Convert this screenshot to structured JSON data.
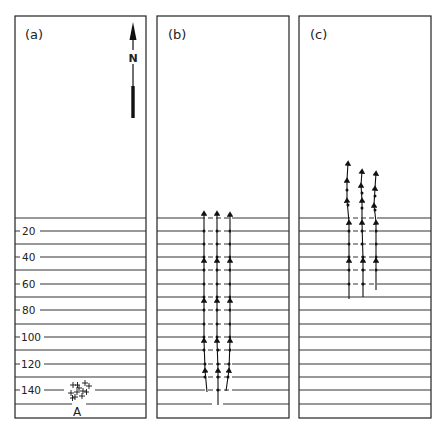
{
  "panels": [
    {
      "id": "a",
      "label": "(a)"
    },
    {
      "id": "b",
      "label": "(b)"
    },
    {
      "id": "c",
      "label": "(c)"
    }
  ],
  "north_arrow": {
    "label": "N"
  },
  "depth_labels": [
    "20",
    "40",
    "60",
    "80",
    "100",
    "120",
    "140"
  ],
  "cluster": {
    "label": "A"
  },
  "colors": {
    "ink": "#222222",
    "background": "#ffffff"
  }
}
